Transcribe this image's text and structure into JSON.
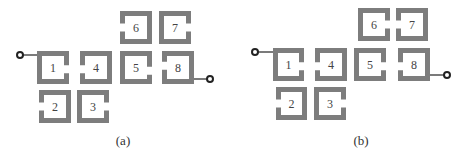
{
  "figure": {
    "stroke_color": "#7d7d7d",
    "panels": [
      {
        "id": "a",
        "caption": "(a)",
        "caption_pos": [
          123,
          140
        ],
        "input_port": {
          "cx": 20,
          "cy": 55,
          "line_to": [
            37,
            55
          ]
        },
        "output_port": {
          "cx": 210,
          "cy": 79,
          "line_from": [
            194,
            79
          ]
        },
        "resonators": [
          {
            "label": "1",
            "x": 37,
            "y": 51,
            "w": 32,
            "h": 33,
            "gap_side": "right",
            "gap_pos": 0.55
          },
          {
            "label": "2",
            "x": 39,
            "y": 90,
            "w": 32,
            "h": 33,
            "gap_side": "left",
            "gap_pos": 0.5
          },
          {
            "label": "3",
            "x": 77,
            "y": 90,
            "w": 32,
            "h": 33,
            "gap_side": "right",
            "gap_pos": 0.5
          },
          {
            "label": "4",
            "x": 80,
            "y": 51,
            "w": 32,
            "h": 33,
            "gap_side": "left",
            "gap_pos": 0.55
          },
          {
            "label": "5",
            "x": 120,
            "y": 51,
            "w": 32,
            "h": 33,
            "gap_side": "right",
            "gap_pos": 0.6
          },
          {
            "label": "6",
            "x": 120,
            "y": 11,
            "w": 32,
            "h": 33,
            "gap_side": "left",
            "gap_pos": 0.5
          },
          {
            "label": "7",
            "x": 159,
            "y": 11,
            "w": 32,
            "h": 33,
            "gap_side": "right",
            "gap_pos": 0.5
          },
          {
            "label": "8",
            "x": 162,
            "y": 51,
            "w": 32,
            "h": 33,
            "gap_side": "left",
            "gap_pos": 0.45
          }
        ]
      },
      {
        "id": "b",
        "caption": "(b)",
        "caption_pos": [
          361,
          140
        ],
        "input_port": {
          "cx": 255,
          "cy": 52,
          "line_to": [
            273,
            52
          ]
        },
        "output_port": {
          "cx": 447,
          "cy": 75,
          "line_from": [
            430,
            75
          ]
        },
        "resonators": [
          {
            "label": "1",
            "x": 273,
            "y": 48,
            "w": 31,
            "h": 33,
            "gap_side": "right",
            "gap_pos": 0.55
          },
          {
            "label": "2",
            "x": 276,
            "y": 87,
            "w": 31,
            "h": 33,
            "gap_side": "left",
            "gap_pos": 0.5
          },
          {
            "label": "3",
            "x": 314,
            "y": 87,
            "w": 32,
            "h": 33,
            "gap_side": "right",
            "gap_pos": 0.5
          },
          {
            "label": "4",
            "x": 315,
            "y": 48,
            "w": 32,
            "h": 33,
            "gap_side": "left",
            "gap_pos": 0.55
          },
          {
            "label": "5",
            "x": 354,
            "y": 48,
            "w": 32,
            "h": 33,
            "gap_side": "right",
            "gap_pos": 0.55
          },
          {
            "label": "6",
            "x": 358,
            "y": 8,
            "w": 32,
            "h": 33,
            "gap_side": "right",
            "gap_pos": 0.5
          },
          {
            "label": "7",
            "x": 396,
            "y": 8,
            "w": 32,
            "h": 33,
            "gap_side": "left",
            "gap_pos": 0.5
          },
          {
            "label": "8",
            "x": 398,
            "y": 48,
            "w": 32,
            "h": 33,
            "gap_side": "left",
            "gap_pos": 0.55
          }
        ]
      }
    ]
  }
}
